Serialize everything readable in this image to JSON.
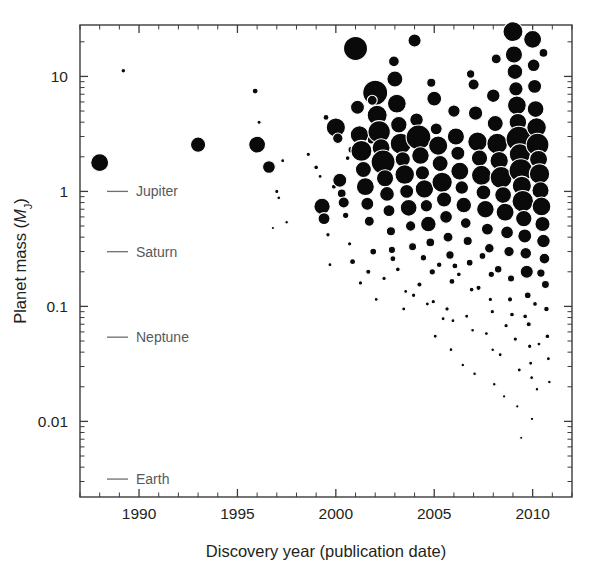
{
  "figure": {
    "background_color": "#ffffff",
    "point_color": "#0a0a0a",
    "point_outline_color": "#ffffff",
    "axis_color": "#3b3b3b",
    "reference_color": "#6d6e71"
  },
  "chart_data": {
    "type": "scatter",
    "title": "",
    "xlabel": "Discovery year (publication date)",
    "ylabel": "Planet mass (MJ)",
    "ylabel_parts": {
      "prefix": "Planet mass (",
      "symbol": "M",
      "subscript": "J",
      "suffix": ")"
    },
    "xlim": [
      1987.0,
      2012.0
    ],
    "ylim": [
      0.0022,
      28.0
    ],
    "yscale": "log",
    "xscale": "linear",
    "grid": false,
    "legend": "none",
    "xticks": [
      1990,
      1995,
      2000,
      2005,
      2010
    ],
    "xtick_labels": [
      "1990",
      "1995",
      "2000",
      "2005",
      "2010"
    ],
    "xminor_step": 1,
    "yticks": [
      10,
      1,
      0.1,
      0.01
    ],
    "ytick_labels": [
      "10",
      "1",
      "0.1",
      "0.01"
    ],
    "yminor_decades": [
      2,
      3,
      4,
      5,
      6,
      7,
      8,
      9
    ],
    "size_encoding": "marker area scales with planet radius / detection prominence",
    "reference_lines": [
      {
        "label": "Jupiter",
        "mass": 1.0
      },
      {
        "label": "Saturn",
        "mass": 0.299
      },
      {
        "label": "Neptune",
        "mass": 0.054
      },
      {
        "label": "Earth",
        "mass": 0.00315
      }
    ],
    "points": [
      {
        "x": 1988.0,
        "y": 1.78,
        "s": 9.0
      },
      {
        "x": 1989.2,
        "y": 11.2,
        "s": 2.3
      },
      {
        "x": 1993.0,
        "y": 2.55,
        "s": 7.6
      },
      {
        "x": 1995.9,
        "y": 7.45,
        "s": 3.0
      },
      {
        "x": 1996.0,
        "y": 2.55,
        "s": 8.4
      },
      {
        "x": 1996.1,
        "y": 4.0,
        "s": 2.1
      },
      {
        "x": 1996.6,
        "y": 1.63,
        "s": 6.4
      },
      {
        "x": 1997.0,
        "y": 1.0,
        "s": 2.1
      },
      {
        "x": 1997.1,
        "y": 0.88,
        "s": 1.9
      },
      {
        "x": 1997.3,
        "y": 1.85,
        "s": 2.0
      },
      {
        "x": 1997.5,
        "y": 0.54,
        "s": 1.8
      },
      {
        "x": 1996.8,
        "y": 0.48,
        "s": 1.6
      },
      {
        "x": 1998.6,
        "y": 2.1,
        "s": 2.2
      },
      {
        "x": 1999.0,
        "y": 1.62,
        "s": 2.4
      },
      {
        "x": 1999.2,
        "y": 1.35,
        "s": 2.0
      },
      {
        "x": 1999.3,
        "y": 0.74,
        "s": 8.2
      },
      {
        "x": 1999.4,
        "y": 0.58,
        "s": 6.0
      },
      {
        "x": 1999.5,
        "y": 4.4,
        "s": 3.0
      },
      {
        "x": 1999.6,
        "y": 0.42,
        "s": 2.2
      },
      {
        "x": 1999.7,
        "y": 0.23,
        "s": 2.0
      },
      {
        "x": 1999.9,
        "y": 1.1,
        "s": 2.5
      },
      {
        "x": 2000.0,
        "y": 3.6,
        "s": 9.6
      },
      {
        "x": 2000.1,
        "y": 2.9,
        "s": 5.2
      },
      {
        "x": 2000.2,
        "y": 1.25,
        "s": 7.0
      },
      {
        "x": 2000.3,
        "y": 0.96,
        "s": 4.4
      },
      {
        "x": 2000.4,
        "y": 0.8,
        "s": 5.6
      },
      {
        "x": 2000.5,
        "y": 0.62,
        "s": 3.2
      },
      {
        "x": 2000.6,
        "y": 1.95,
        "s": 2.4
      },
      {
        "x": 2000.7,
        "y": 0.35,
        "s": 2.2
      },
      {
        "x": 2000.8,
        "y": 2.3,
        "s": 3.6
      },
      {
        "x": 2001.0,
        "y": 17.5,
        "s": 12.0
      },
      {
        "x": 2001.1,
        "y": 5.4,
        "s": 7.0
      },
      {
        "x": 2001.2,
        "y": 3.1,
        "s": 9.2
      },
      {
        "x": 2001.3,
        "y": 2.25,
        "s": 10.5
      },
      {
        "x": 2001.4,
        "y": 1.55,
        "s": 8.0
      },
      {
        "x": 2001.5,
        "y": 1.1,
        "s": 9.0
      },
      {
        "x": 2001.6,
        "y": 0.78,
        "s": 6.5
      },
      {
        "x": 2001.7,
        "y": 0.55,
        "s": 5.0
      },
      {
        "x": 2001.8,
        "y": 2.8,
        "s": 4.0
      },
      {
        "x": 2001.9,
        "y": 0.3,
        "s": 3.4
      },
      {
        "x": 2002.0,
        "y": 7.2,
        "s": 12.5
      },
      {
        "x": 2002.1,
        "y": 4.6,
        "s": 10.0
      },
      {
        "x": 2002.2,
        "y": 3.3,
        "s": 11.2
      },
      {
        "x": 2002.3,
        "y": 2.4,
        "s": 9.0
      },
      {
        "x": 2002.4,
        "y": 1.8,
        "s": 12.0
      },
      {
        "x": 2002.5,
        "y": 1.3,
        "s": 8.6
      },
      {
        "x": 2002.6,
        "y": 0.95,
        "s": 7.4
      },
      {
        "x": 2002.7,
        "y": 0.68,
        "s": 6.0
      },
      {
        "x": 2002.8,
        "y": 0.45,
        "s": 4.6
      },
      {
        "x": 2002.9,
        "y": 0.26,
        "s": 3.0
      },
      {
        "x": 2003.0,
        "y": 9.5,
        "s": 8.0
      },
      {
        "x": 2003.1,
        "y": 5.8,
        "s": 9.4
      },
      {
        "x": 2003.2,
        "y": 3.8,
        "s": 8.2
      },
      {
        "x": 2003.3,
        "y": 2.6,
        "s": 10.6
      },
      {
        "x": 2003.4,
        "y": 1.9,
        "s": 7.6
      },
      {
        "x": 2003.5,
        "y": 1.4,
        "s": 9.8
      },
      {
        "x": 2003.6,
        "y": 1.0,
        "s": 7.0
      },
      {
        "x": 2003.7,
        "y": 0.72,
        "s": 8.4
      },
      {
        "x": 2003.8,
        "y": 0.5,
        "s": 5.2
      },
      {
        "x": 2003.9,
        "y": 0.33,
        "s": 4.0
      },
      {
        "x": 2004.0,
        "y": 20.5,
        "s": 6.6
      },
      {
        "x": 2004.1,
        "y": 4.2,
        "s": 6.8
      },
      {
        "x": 2004.2,
        "y": 2.95,
        "s": 12.4
      },
      {
        "x": 2004.3,
        "y": 2.05,
        "s": 8.8
      },
      {
        "x": 2004.4,
        "y": 1.45,
        "s": 7.2
      },
      {
        "x": 2004.5,
        "y": 1.05,
        "s": 9.2
      },
      {
        "x": 2004.6,
        "y": 0.75,
        "s": 6.2
      },
      {
        "x": 2004.7,
        "y": 0.52,
        "s": 7.8
      },
      {
        "x": 2004.8,
        "y": 0.36,
        "s": 4.4
      },
      {
        "x": 2004.9,
        "y": 0.2,
        "s": 3.2
      },
      {
        "x": 2004.95,
        "y": 0.11,
        "s": 2.2
      },
      {
        "x": 2005.0,
        "y": 6.4,
        "s": 7.4
      },
      {
        "x": 2005.1,
        "y": 3.5,
        "s": 6.0
      },
      {
        "x": 2005.2,
        "y": 2.5,
        "s": 9.6
      },
      {
        "x": 2005.3,
        "y": 1.75,
        "s": 8.0
      },
      {
        "x": 2005.4,
        "y": 1.2,
        "s": 10.2
      },
      {
        "x": 2005.5,
        "y": 0.85,
        "s": 7.6
      },
      {
        "x": 2005.6,
        "y": 0.6,
        "s": 6.4
      },
      {
        "x": 2005.7,
        "y": 0.4,
        "s": 5.0
      },
      {
        "x": 2005.8,
        "y": 0.28,
        "s": 4.2
      },
      {
        "x": 2005.9,
        "y": 0.165,
        "s": 3.0
      },
      {
        "x": 2005.95,
        "y": 0.075,
        "s": 2.0
      },
      {
        "x": 2006.0,
        "y": 5.0,
        "s": 6.2
      },
      {
        "x": 2006.1,
        "y": 3.0,
        "s": 8.6
      },
      {
        "x": 2006.2,
        "y": 2.15,
        "s": 7.0
      },
      {
        "x": 2006.3,
        "y": 1.5,
        "s": 9.0
      },
      {
        "x": 2006.4,
        "y": 1.08,
        "s": 6.8
      },
      {
        "x": 2006.5,
        "y": 0.76,
        "s": 7.8
      },
      {
        "x": 2006.6,
        "y": 0.53,
        "s": 5.4
      },
      {
        "x": 2006.7,
        "y": 0.37,
        "s": 4.6
      },
      {
        "x": 2006.8,
        "y": 0.24,
        "s": 3.4
      },
      {
        "x": 2006.9,
        "y": 0.14,
        "s": 2.4
      },
      {
        "x": 2006.95,
        "y": 0.062,
        "s": 1.9
      },
      {
        "x": 2007.0,
        "y": 8.5,
        "s": 5.6
      },
      {
        "x": 2007.1,
        "y": 4.8,
        "s": 7.2
      },
      {
        "x": 2007.2,
        "y": 2.7,
        "s": 9.8
      },
      {
        "x": 2007.3,
        "y": 1.95,
        "s": 8.2
      },
      {
        "x": 2007.4,
        "y": 1.38,
        "s": 10.0
      },
      {
        "x": 2007.5,
        "y": 0.98,
        "s": 7.4
      },
      {
        "x": 2007.6,
        "y": 0.7,
        "s": 8.8
      },
      {
        "x": 2007.7,
        "y": 0.47,
        "s": 6.0
      },
      {
        "x": 2007.8,
        "y": 0.32,
        "s": 4.8
      },
      {
        "x": 2007.9,
        "y": 0.19,
        "s": 3.2
      },
      {
        "x": 2007.95,
        "y": 0.09,
        "s": 2.2
      },
      {
        "x": 2007.97,
        "y": 0.042,
        "s": 1.8
      },
      {
        "x": 2008.0,
        "y": 6.8,
        "s": 6.8
      },
      {
        "x": 2008.1,
        "y": 3.9,
        "s": 8.0
      },
      {
        "x": 2008.2,
        "y": 2.6,
        "s": 10.4
      },
      {
        "x": 2008.3,
        "y": 1.85,
        "s": 9.2
      },
      {
        "x": 2008.4,
        "y": 1.32,
        "s": 11.0
      },
      {
        "x": 2008.5,
        "y": 0.93,
        "s": 8.4
      },
      {
        "x": 2008.6,
        "y": 0.66,
        "s": 9.0
      },
      {
        "x": 2008.7,
        "y": 0.44,
        "s": 6.4
      },
      {
        "x": 2008.8,
        "y": 0.3,
        "s": 5.2
      },
      {
        "x": 2008.9,
        "y": 0.175,
        "s": 3.6
      },
      {
        "x": 2008.95,
        "y": 0.085,
        "s": 2.4
      },
      {
        "x": 2009.0,
        "y": 24.5,
        "s": 10.0
      },
      {
        "x": 2009.05,
        "y": 15.5,
        "s": 8.6
      },
      {
        "x": 2009.1,
        "y": 11.0,
        "s": 7.8
      },
      {
        "x": 2009.15,
        "y": 7.8,
        "s": 7.2
      },
      {
        "x": 2009.2,
        "y": 5.6,
        "s": 9.4
      },
      {
        "x": 2009.25,
        "y": 4.0,
        "s": 8.8
      },
      {
        "x": 2009.3,
        "y": 2.85,
        "s": 12.8
      },
      {
        "x": 2009.35,
        "y": 2.1,
        "s": 10.6
      },
      {
        "x": 2009.4,
        "y": 1.52,
        "s": 11.8
      },
      {
        "x": 2009.45,
        "y": 1.12,
        "s": 9.6
      },
      {
        "x": 2009.5,
        "y": 0.82,
        "s": 10.8
      },
      {
        "x": 2009.55,
        "y": 0.58,
        "s": 8.2
      },
      {
        "x": 2009.6,
        "y": 0.41,
        "s": 7.0
      },
      {
        "x": 2009.65,
        "y": 0.29,
        "s": 5.8
      },
      {
        "x": 2009.7,
        "y": 0.2,
        "s": 6.6
      },
      {
        "x": 2009.75,
        "y": 0.125,
        "s": 3.4
      },
      {
        "x": 2009.8,
        "y": 0.07,
        "s": 2.6
      },
      {
        "x": 2009.85,
        "y": 0.045,
        "s": 2.2
      },
      {
        "x": 2009.9,
        "y": 0.032,
        "s": 2.0
      },
      {
        "x": 2009.95,
        "y": 0.024,
        "s": 1.9
      },
      {
        "x": 2009.97,
        "y": 0.0105,
        "s": 1.7
      },
      {
        "x": 2010.0,
        "y": 21.0,
        "s": 9.0
      },
      {
        "x": 2010.05,
        "y": 12.5,
        "s": 6.4
      },
      {
        "x": 2010.1,
        "y": 8.2,
        "s": 7.0
      },
      {
        "x": 2010.15,
        "y": 5.2,
        "s": 8.4
      },
      {
        "x": 2010.2,
        "y": 3.6,
        "s": 9.8
      },
      {
        "x": 2010.25,
        "y": 2.55,
        "s": 11.4
      },
      {
        "x": 2010.3,
        "y": 1.9,
        "s": 9.0
      },
      {
        "x": 2010.35,
        "y": 1.42,
        "s": 10.2
      },
      {
        "x": 2010.4,
        "y": 1.02,
        "s": 8.6
      },
      {
        "x": 2010.45,
        "y": 0.74,
        "s": 9.4
      },
      {
        "x": 2010.5,
        "y": 0.52,
        "s": 7.6
      },
      {
        "x": 2010.55,
        "y": 0.37,
        "s": 6.8
      },
      {
        "x": 2010.6,
        "y": 0.26,
        "s": 5.4
      },
      {
        "x": 2010.65,
        "y": 0.155,
        "s": 4.0
      },
      {
        "x": 2010.7,
        "y": 0.095,
        "s": 2.8
      },
      {
        "x": 2010.75,
        "y": 0.055,
        "s": 2.4
      },
      {
        "x": 2010.8,
        "y": 0.035,
        "s": 2.0
      },
      {
        "x": 2010.85,
        "y": 0.022,
        "s": 1.8
      },
      {
        "x": 2002.05,
        "y": 0.115,
        "s": 2.0
      },
      {
        "x": 2002.45,
        "y": 0.175,
        "s": 2.2
      },
      {
        "x": 2003.15,
        "y": 0.21,
        "s": 2.4
      },
      {
        "x": 2003.55,
        "y": 0.135,
        "s": 2.0
      },
      {
        "x": 2004.25,
        "y": 0.155,
        "s": 2.6
      },
      {
        "x": 2004.65,
        "y": 0.105,
        "s": 2.0
      },
      {
        "x": 2005.25,
        "y": 0.23,
        "s": 2.8
      },
      {
        "x": 2005.65,
        "y": 0.095,
        "s": 2.2
      },
      {
        "x": 2006.25,
        "y": 0.19,
        "s": 2.4
      },
      {
        "x": 2006.65,
        "y": 0.082,
        "s": 2.0
      },
      {
        "x": 2007.25,
        "y": 0.145,
        "s": 2.6
      },
      {
        "x": 2007.65,
        "y": 0.058,
        "s": 2.0
      },
      {
        "x": 2008.25,
        "y": 0.21,
        "s": 3.8
      },
      {
        "x": 2008.65,
        "y": 0.068,
        "s": 2.2
      },
      {
        "x": 2008.35,
        "y": 0.038,
        "s": 2.0
      },
      {
        "x": 2009.12,
        "y": 0.052,
        "s": 2.2
      },
      {
        "x": 2009.32,
        "y": 0.028,
        "s": 2.0
      },
      {
        "x": 2010.12,
        "y": 0.105,
        "s": 2.4
      },
      {
        "x": 2010.32,
        "y": 0.047,
        "s": 2.0
      },
      {
        "x": 2005.05,
        "y": 0.055,
        "s": 2.0
      },
      {
        "x": 2005.85,
        "y": 0.042,
        "s": 1.9
      },
      {
        "x": 2006.45,
        "y": 0.031,
        "s": 1.8
      },
      {
        "x": 2007.05,
        "y": 0.026,
        "s": 1.8
      },
      {
        "x": 2008.05,
        "y": 0.021,
        "s": 1.8
      },
      {
        "x": 2008.55,
        "y": 0.0165,
        "s": 1.7
      },
      {
        "x": 2009.22,
        "y": 0.0135,
        "s": 1.7
      },
      {
        "x": 2009.42,
        "y": 0.0072,
        "s": 1.6
      },
      {
        "x": 2010.22,
        "y": 0.019,
        "s": 1.8
      },
      {
        "x": 2001.25,
        "y": 0.16,
        "s": 2.2
      },
      {
        "x": 2001.65,
        "y": 0.2,
        "s": 2.6
      },
      {
        "x": 2000.85,
        "y": 0.245,
        "s": 3.0
      },
      {
        "x": 2003.95,
        "y": 0.125,
        "s": 2.2
      },
      {
        "x": 2002.85,
        "y": 0.31,
        "s": 3.6
      },
      {
        "x": 2004.45,
        "y": 0.265,
        "s": 3.2
      },
      {
        "x": 2006.05,
        "y": 0.225,
        "s": 3.0
      },
      {
        "x": 2007.45,
        "y": 0.275,
        "s": 3.4
      },
      {
        "x": 2008.85,
        "y": 0.115,
        "s": 2.6
      },
      {
        "x": 2009.62,
        "y": 0.082,
        "s": 2.4
      },
      {
        "x": 2010.42,
        "y": 0.195,
        "s": 4.2
      },
      {
        "x": 2001.85,
        "y": 6.2,
        "s": 5.0
      },
      {
        "x": 2002.95,
        "y": 13.5,
        "s": 5.4
      },
      {
        "x": 2004.85,
        "y": 8.8,
        "s": 4.6
      },
      {
        "x": 2006.85,
        "y": 10.5,
        "s": 4.2
      },
      {
        "x": 2008.15,
        "y": 14.2,
        "s": 5.0
      },
      {
        "x": 2010.55,
        "y": 16.0,
        "s": 4.4
      },
      {
        "x": 2003.45,
        "y": 0.095,
        "s": 2.0
      },
      {
        "x": 2005.45,
        "y": 0.078,
        "s": 2.0
      },
      {
        "x": 2007.85,
        "y": 0.115,
        "s": 2.2
      }
    ]
  }
}
